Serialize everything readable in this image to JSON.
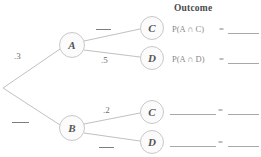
{
  "diagram": {
    "type": "probability-tree",
    "title_column": "Outcome",
    "nodes": {
      "root": {
        "label": "",
        "x": 2,
        "y": 88
      },
      "a": {
        "label": "A",
        "x": 72,
        "y": 45
      },
      "b": {
        "label": "B",
        "x": 72,
        "y": 128
      },
      "c_top": {
        "label": "C",
        "x": 152,
        "y": 28
      },
      "d_top": {
        "label": "D",
        "x": 152,
        "y": 58
      },
      "c_bottom": {
        "label": "C",
        "x": 152,
        "y": 112
      },
      "d_bottom": {
        "label": "D",
        "x": 152,
        "y": 142
      }
    },
    "edges": [
      {
        "name": "root-to-a",
        "from": "root",
        "to": "a",
        "label": ".3",
        "blank": false
      },
      {
        "name": "root-to-b",
        "from": "root",
        "to": "b",
        "label": "",
        "blank": true
      },
      {
        "name": "a-to-c",
        "from": "a",
        "to": "c_top",
        "label": "",
        "blank": true
      },
      {
        "name": "a-to-d",
        "from": "a",
        "to": "d_top",
        "label": ".5",
        "blank": false
      },
      {
        "name": "b-to-c",
        "from": "b",
        "to": "c_bottom",
        "label": ".2",
        "blank": false
      },
      {
        "name": "b-to-d",
        "from": "b",
        "to": "d_bottom",
        "label": "",
        "blank": true
      }
    ],
    "outcomes": [
      {
        "name": "outcome-a-and-c",
        "expression": "P(A ∩ C)",
        "equals": "=",
        "value": "",
        "blank_expression": false
      },
      {
        "name": "outcome-a-and-d",
        "expression": "P(A ∩ D)",
        "equals": "=",
        "value": "",
        "blank_expression": false
      },
      {
        "name": "outcome-b-and-c",
        "expression": "",
        "equals": "=",
        "value": "",
        "blank_expression": true
      },
      {
        "name": "outcome-b-and-d",
        "expression": "",
        "equals": "=",
        "value": "",
        "blank_expression": true
      }
    ]
  },
  "colors": {
    "line": "#b9b9b9",
    "node_stroke": "#c2c2c2",
    "node_fill": "#fbfbfb",
    "text": "#555555",
    "muted_text": "#8a8a8a",
    "background": "#ffffff"
  }
}
